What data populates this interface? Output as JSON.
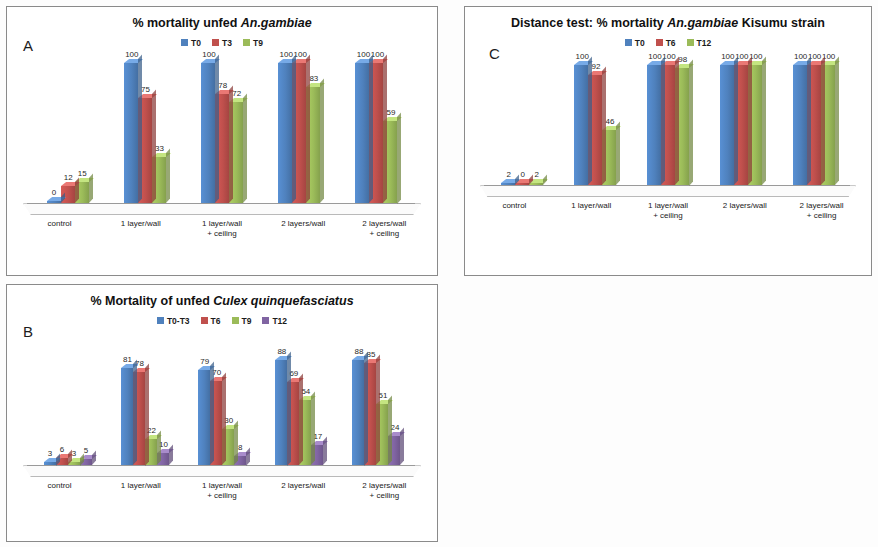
{
  "figure": {
    "panels": [
      "A",
      "B",
      "C"
    ]
  },
  "panel_a": {
    "letter": "A",
    "title_prefix": "% mortality unfed ",
    "title_italic": "An.gambiae",
    "chart_data": {
      "type": "bar",
      "title": "% mortality unfed An.gambiae",
      "xlabel": "",
      "ylabel": "% mortality",
      "ylim": [
        0,
        100
      ],
      "grid": false,
      "legend_position": "top",
      "categories": [
        "control",
        "1 layer/wall",
        "1 layer/wall\n+ ceiling",
        "2 layers/wall",
        "2 layers/wall\n+ ceiling"
      ],
      "series": [
        {
          "name": "T0",
          "color": "#4F81BD",
          "values": [
            0,
            100,
            100,
            100,
            100
          ]
        },
        {
          "name": "T3",
          "color": "#C0504D",
          "values": [
            12,
            75,
            78,
            100,
            100
          ]
        },
        {
          "name": "T9",
          "color": "#9BBB59",
          "values": [
            15,
            33,
            72,
            83,
            59
          ]
        }
      ]
    }
  },
  "panel_b": {
    "letter": "B",
    "title_prefix": "% Mortality of unfed ",
    "title_italic": "Culex quinquefasciatus",
    "chart_data": {
      "type": "bar",
      "title": "% Mortality of unfed Culex quinquefasciatus",
      "xlabel": "",
      "ylabel": "% mortality",
      "ylim": [
        0,
        100
      ],
      "grid": false,
      "legend_position": "top",
      "categories": [
        "control",
        "1 layer/wall",
        "1 layer/wall\n+ ceiling",
        "2 layers/wall",
        "2 layers/wall\n+ ceiling"
      ],
      "series": [
        {
          "name": "T0-T3",
          "color": "#4F81BD",
          "values": [
            3,
            81,
            79,
            88,
            88
          ]
        },
        {
          "name": "T6",
          "color": "#C0504D",
          "values": [
            6,
            78,
            70,
            69,
            85
          ]
        },
        {
          "name": "T9",
          "color": "#9BBB59",
          "values": [
            3,
            22,
            30,
            54,
            51
          ]
        },
        {
          "name": "T12",
          "color": "#8064A2",
          "values": [
            5,
            10,
            8,
            17,
            24
          ]
        }
      ]
    }
  },
  "panel_c": {
    "letter": "C",
    "title_prefix": "Distance test: % mortality ",
    "title_italic": "An.gambiae",
    "title_suffix": " Kisumu strain",
    "chart_data": {
      "type": "bar",
      "title": "Distance test: % mortality An.gambiae Kisumu strain",
      "xlabel": "",
      "ylabel": "% mortality",
      "ylim": [
        0,
        100
      ],
      "grid": false,
      "legend_position": "top",
      "categories": [
        "control",
        "1 layer/wall",
        "1 layer/wall\n+ ceiling",
        "2 layers/wall",
        "2 layers/wall\n+ ceiling"
      ],
      "series": [
        {
          "name": "T0",
          "color": "#4F81BD",
          "values": [
            2,
            100,
            100,
            100,
            100
          ]
        },
        {
          "name": "T6",
          "color": "#C0504D",
          "values": [
            0,
            92,
            100,
            100,
            100
          ]
        },
        {
          "name": "T12",
          "color": "#9BBB59",
          "values": [
            2,
            46,
            98,
            100,
            100
          ]
        }
      ]
    }
  }
}
